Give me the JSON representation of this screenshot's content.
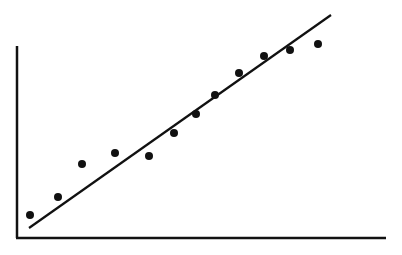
{
  "chart_data": {
    "type": "scatter",
    "title": "",
    "xlabel": "",
    "ylabel": "",
    "grid": false,
    "legend": null,
    "colors": {
      "points": "#111111",
      "line": "#111111",
      "axes": "#111111",
      "background": "#ffffff"
    },
    "points_px": [
      [
        30,
        215
      ],
      [
        58,
        197
      ],
      [
        82,
        164
      ],
      [
        115,
        153
      ],
      [
        149,
        156
      ],
      [
        174,
        133
      ],
      [
        196,
        114
      ],
      [
        215,
        95
      ],
      [
        239,
        73
      ],
      [
        264,
        56
      ],
      [
        290,
        50
      ],
      [
        318,
        44
      ]
    ],
    "x": [
      1,
      2,
      3,
      4,
      5,
      6,
      7,
      8,
      9,
      10,
      11,
      12
    ],
    "values": [
      1.2,
      2.0,
      3.5,
      4.0,
      3.9,
      4.9,
      5.8,
      6.6,
      7.6,
      8.4,
      8.7,
      8.9
    ],
    "trend_line_px": {
      "x1": 29,
      "y1": 228,
      "x2": 331,
      "y2": 15
    },
    "axes_px": {
      "origin": [
        17,
        238
      ],
      "y_top": 46,
      "x_right": 386
    }
  }
}
